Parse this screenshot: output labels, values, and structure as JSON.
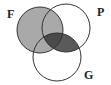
{
  "diagram": {
    "type": "venn",
    "sets": [
      {
        "id": "F",
        "label": "F",
        "cx": 40,
        "cy": 30,
        "r": 23,
        "label_x": 7,
        "label_y": 18
      },
      {
        "id": "P",
        "label": "P",
        "cx": 66,
        "cy": 28,
        "r": 24,
        "label_x": 97,
        "label_y": 16
      },
      {
        "id": "G",
        "label": "G",
        "cx": 57,
        "cy": 57,
        "r": 24,
        "label_x": 84,
        "label_y": 79
      }
    ],
    "shaded_regions": [
      {
        "region": "F",
        "color": "#a9a9a9"
      },
      {
        "region": "P∩G",
        "color": "#5a5a5a"
      },
      {
        "region": "F∩P∩G",
        "color": "#4a4a4a"
      }
    ],
    "stroke_color": "#333333",
    "background": "#ffffff"
  }
}
